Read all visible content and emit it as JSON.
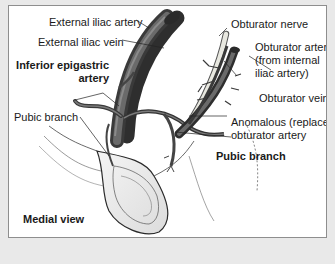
{
  "figure": {
    "view_label": "Medial view",
    "labels": {
      "external_iliac_artery": "External iliac artery",
      "external_iliac_vein": "External iliac vein",
      "inferior_epigastric_artery": "Inferior epigastric\nartery",
      "pubic_branch_left": "Pubic branch",
      "obturator_nerve": "Obturator nerve",
      "obturator_artery": "Obturator artery\n(from internal\niliac artery)",
      "obturator_vein": "Obturator vein",
      "anomalous_obturator_artery": "Anomalous (replaced)\nobturator artery",
      "pubic_branch_right": "Pubic branch"
    },
    "colors": {
      "vessel": "#5a5a5a",
      "vessel_dark": "#3a3a3a",
      "vessel_highlight": "#8a8a8a",
      "nerve": "#e0e0d8",
      "background": "#e9e9e9",
      "panel": "#ffffff"
    }
  }
}
